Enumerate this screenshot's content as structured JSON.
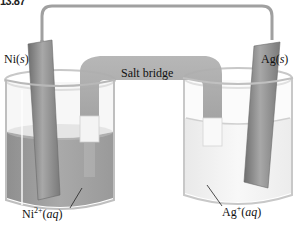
{
  "figure": {
    "number": "13.87"
  },
  "diagram": {
    "components": {
      "left_electrode": {
        "element": "Ni",
        "state": "s"
      },
      "right_electrode": {
        "element": "Ag",
        "state": "s"
      },
      "left_solution": {
        "ion": "Ni",
        "charge": "2+",
        "state": "aq"
      },
      "right_solution": {
        "ion": "Ag",
        "charge": "+",
        "state": "aq"
      },
      "bridge": "Salt bridge"
    },
    "labels": {
      "ni_s": "Ni(s)",
      "ag_s": "Ag(s)",
      "ni_aq_base": "Ni",
      "ni_aq_charge": "2+",
      "ni_aq_state": "(aq)",
      "ag_aq_base": "Ag",
      "ag_aq_charge": "+",
      "ag_aq_state": "(aq)",
      "salt_bridge": "Salt bridge"
    },
    "colors": {
      "electrode": "#8a8a8a",
      "ni_solution": "#9a9a9a",
      "ag_solution": "#f2f2f2",
      "bridge": "#a6a6a6",
      "wire": "#999999",
      "glass": "#cfcfcf"
    }
  }
}
